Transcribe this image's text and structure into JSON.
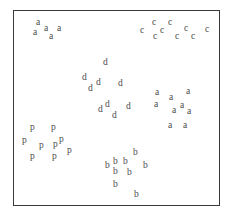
{
  "figure": {
    "title": "",
    "border_color": "#3a3a3a",
    "point_color": "#4a4a4a",
    "background": "#ffffff"
  },
  "chart_data": {
    "type": "scatter",
    "title": "",
    "subtitle": "",
    "xlabel": "",
    "ylabel": "",
    "xlim": [
      0,
      231
    ],
    "ylim": [
      0,
      221
    ],
    "grid": false,
    "legend": "none",
    "axis_ticks": false,
    "marker_style": "text-label",
    "annotations": [],
    "legend_entries": [],
    "series": [
      {
        "name": "a-upper-left",
        "label": "a",
        "count": 5,
        "points": [
          {
            "label": "a",
            "x": 36,
            "y": 18
          },
          {
            "label": "a",
            "x": 44,
            "y": 24
          },
          {
            "label": "a",
            "x": 57,
            "y": 24
          },
          {
            "label": "a",
            "x": 33,
            "y": 28
          },
          {
            "label": "a",
            "x": 49,
            "y": 32
          }
        ]
      },
      {
        "name": "c-upper-right",
        "label": "c",
        "count": 9,
        "points": [
          {
            "label": "c",
            "x": 152,
            "y": 18
          },
          {
            "label": "c",
            "x": 168,
            "y": 18
          },
          {
            "label": "c",
            "x": 140,
            "y": 26
          },
          {
            "label": "c",
            "x": 184,
            "y": 24
          },
          {
            "label": "c",
            "x": 160,
            "y": 26
          },
          {
            "label": "c",
            "x": 205,
            "y": 25
          },
          {
            "label": "c",
            "x": 153,
            "y": 32
          },
          {
            "label": "c",
            "x": 175,
            "y": 32
          },
          {
            "label": "c",
            "x": 191,
            "y": 32
          }
        ]
      },
      {
        "name": "d-center",
        "label": "d",
        "count": 8,
        "points": [
          {
            "label": "d",
            "x": 103,
            "y": 58
          },
          {
            "label": "d",
            "x": 82,
            "y": 73
          },
          {
            "label": "d",
            "x": 96,
            "y": 78
          },
          {
            "label": "d",
            "x": 118,
            "y": 79
          },
          {
            "label": "d",
            "x": 88,
            "y": 84
          },
          {
            "label": "d",
            "x": 105,
            "y": 100
          },
          {
            "label": "d",
            "x": 126,
            "y": 102
          },
          {
            "label": "d",
            "x": 98,
            "y": 105
          },
          {
            "label": "d",
            "x": 112,
            "y": 111
          }
        ]
      },
      {
        "name": "a-right",
        "label": "a",
        "count": 8,
        "points": [
          {
            "label": "a",
            "x": 155,
            "y": 88
          },
          {
            "label": "a",
            "x": 186,
            "y": 87
          },
          {
            "label": "a",
            "x": 169,
            "y": 93
          },
          {
            "label": "a",
            "x": 154,
            "y": 100
          },
          {
            "label": "a",
            "x": 180,
            "y": 101
          },
          {
            "label": "a",
            "x": 172,
            "y": 106
          },
          {
            "label": "a",
            "x": 187,
            "y": 107
          },
          {
            "label": "a",
            "x": 168,
            "y": 121
          },
          {
            "label": "a",
            "x": 183,
            "y": 121
          }
        ]
      },
      {
        "name": "p-lower-left",
        "label": "p",
        "count": 9,
        "points": [
          {
            "label": "p",
            "x": 30,
            "y": 123
          },
          {
            "label": "p",
            "x": 51,
            "y": 123
          },
          {
            "label": "p",
            "x": 22,
            "y": 136
          },
          {
            "label": "p",
            "x": 39,
            "y": 141
          },
          {
            "label": "p",
            "x": 53,
            "y": 140
          },
          {
            "label": "p",
            "x": 59,
            "y": 135
          },
          {
            "label": "p",
            "x": 67,
            "y": 146
          },
          {
            "label": "p",
            "x": 30,
            "y": 152
          },
          {
            "label": "p",
            "x": 52,
            "y": 152
          }
        ]
      },
      {
        "name": "b-lower-center",
        "label": "b",
        "count": 9,
        "points": [
          {
            "label": "b",
            "x": 133,
            "y": 148
          },
          {
            "label": "b",
            "x": 113,
            "y": 157
          },
          {
            "label": "b",
            "x": 123,
            "y": 157
          },
          {
            "label": "b",
            "x": 105,
            "y": 161
          },
          {
            "label": "b",
            "x": 143,
            "y": 161
          },
          {
            "label": "b",
            "x": 113,
            "y": 167
          },
          {
            "label": "b",
            "x": 127,
            "y": 168
          },
          {
            "label": "b",
            "x": 113,
            "y": 180
          },
          {
            "label": "b",
            "x": 134,
            "y": 190
          }
        ]
      }
    ]
  }
}
